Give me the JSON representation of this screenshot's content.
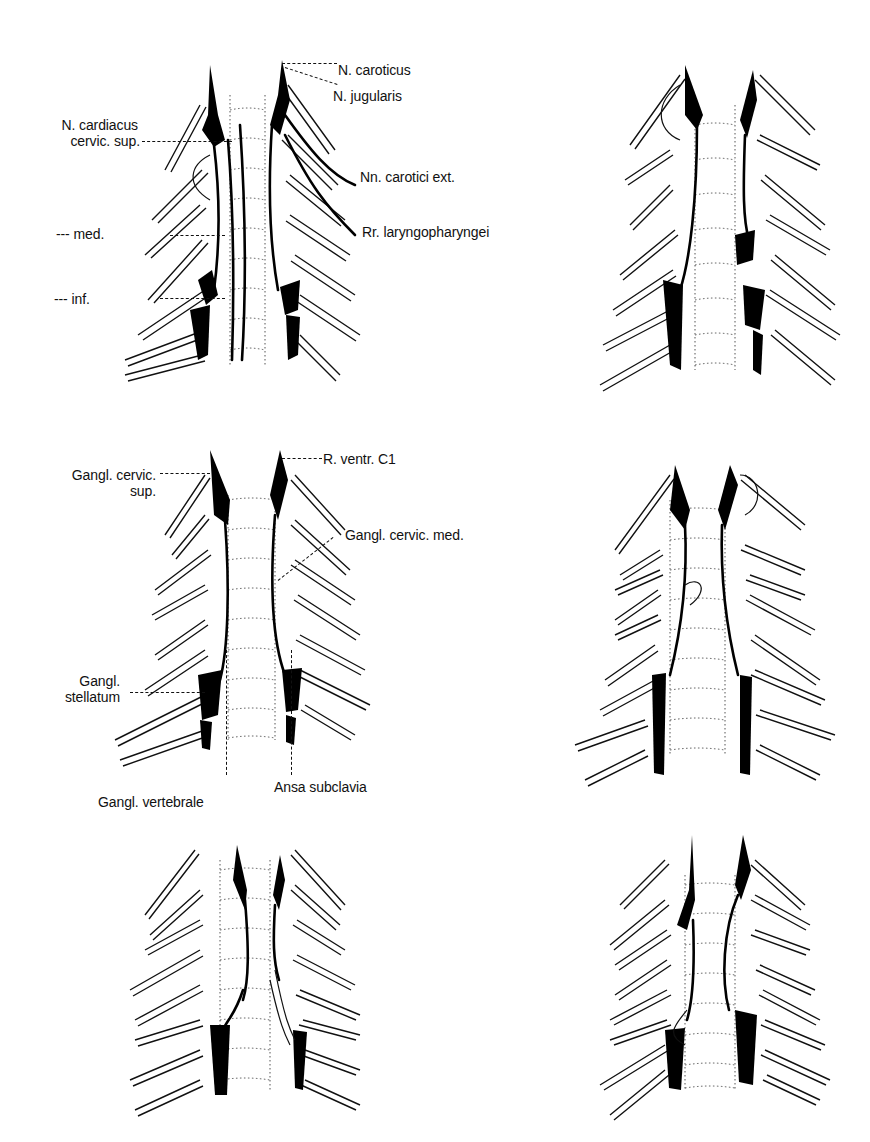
{
  "figure": {
    "panels": [
      {
        "id": "top-left",
        "labels": {
          "n_caroticus": "N. caroticus",
          "n_jugularis": "N. jugularis",
          "n_cardiacus_1": "N. cardiacus",
          "n_cardiacus_2": "cervic. sup.",
          "nn_carotici_ext": "Nn. carotici ext.",
          "med": "--- med.",
          "rr_laryngopharyngei": "Rr. laryngopharyngei",
          "inf": "--- inf."
        }
      },
      {
        "id": "top-right",
        "labels": {}
      },
      {
        "id": "middle-left",
        "labels": {
          "r_ventr_c1": "R. ventr. C1",
          "gangl_cervic_sup_1": "Gangl. cervic.",
          "gangl_cervic_sup_2": "sup.",
          "gangl_cervic_med": "Gangl. cervic. med.",
          "gangl_stellatum_1": "Gangl.",
          "gangl_stellatum_2": "stellatum",
          "gangl_vertebrale": "Gangl. vertebrale",
          "ansa_subclavia": "Ansa subclavia"
        }
      },
      {
        "id": "middle-right",
        "labels": {}
      },
      {
        "id": "bottom-left",
        "labels": {}
      },
      {
        "id": "bottom-right",
        "labels": {}
      }
    ],
    "colors": {
      "ink": "#000000",
      "background": "#ffffff",
      "vertebra_dots": "#555555"
    }
  }
}
